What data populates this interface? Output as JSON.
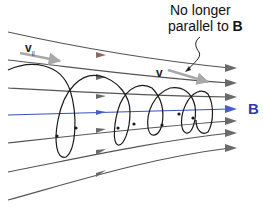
{
  "diagram": {
    "labels": {
      "callout_line1": "No longer",
      "callout_line2_prefix": "parallel to ",
      "callout_line2_bold": "B",
      "field_label": "B",
      "velocity_label": "v",
      "parallel_velocity_label": "v",
      "parallel_velocity_subscript": "||"
    },
    "colors": {
      "field_line": "#555555",
      "central_field_line": "#3a4fc0",
      "orbit": "#1a1a1a",
      "velocity_arrow": "#a8a8a8",
      "field_label": "#2a3ca8"
    },
    "field_lines_count": 7,
    "orbit_loops_count": 4
  }
}
